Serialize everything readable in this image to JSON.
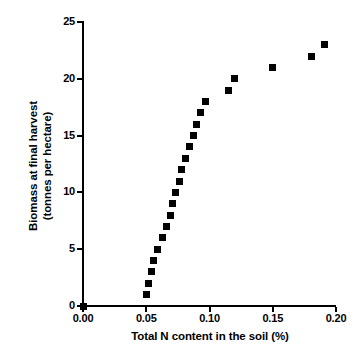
{
  "chart_data": {
    "type": "scatter",
    "title": "",
    "xlabel": "Total N content in the soil (%)",
    "ylabel_line1": "Biomass at final harvest",
    "ylabel_line2": "(tonnes per hectare)",
    "xlim": [
      0.0,
      0.2
    ],
    "ylim": [
      0,
      25
    ],
    "xticks": [
      "0.00",
      "0.05",
      "0.10",
      "0.15",
      "0.20"
    ],
    "xtick_values": [
      0.0,
      0.05,
      0.1,
      0.15,
      0.2
    ],
    "yticks": [
      "0",
      "5",
      "10",
      "15",
      "20",
      "25"
    ],
    "ytick_values": [
      0,
      5,
      10,
      15,
      20,
      25
    ],
    "grid": false,
    "legend": false,
    "marker": "square",
    "marker_color": "#000000",
    "series": [
      {
        "name": "Biomass vs soil N",
        "x": [
          0.0,
          0.05,
          0.052,
          0.054,
          0.056,
          0.059,
          0.063,
          0.066,
          0.069,
          0.071,
          0.073,
          0.076,
          0.078,
          0.081,
          0.084,
          0.087,
          0.09,
          0.093,
          0.097,
          0.115,
          0.12,
          0.15,
          0.181,
          0.191
        ],
        "y": [
          0,
          1,
          2,
          3,
          4,
          5,
          6,
          7,
          8,
          9,
          10,
          11,
          12,
          13,
          14,
          15,
          16,
          17,
          18,
          19,
          20,
          21,
          22,
          23
        ]
      }
    ]
  }
}
